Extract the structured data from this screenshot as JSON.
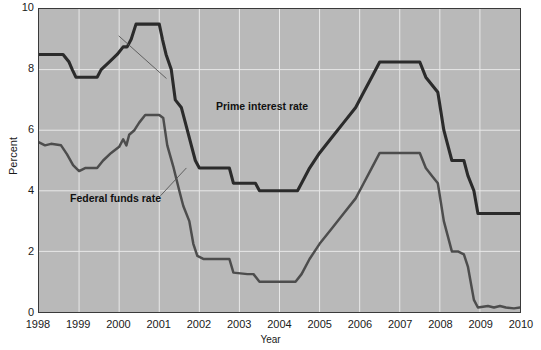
{
  "chart_data": {
    "type": "line",
    "title": "",
    "xlabel": "Year",
    "ylabel": "Percent",
    "xlim": [
      1998,
      2010
    ],
    "ylim": [
      0,
      10
    ],
    "grid": true,
    "legend_position": "inline-annotation",
    "x_tick_labels": [
      "1998",
      "1999",
      "2000",
      "2001",
      "2002",
      "2003",
      "2004",
      "2005",
      "2006",
      "2007",
      "2008",
      "2009",
      "2010"
    ],
    "y_tick_labels": [
      "0",
      "2",
      "4",
      "6",
      "8",
      "10"
    ],
    "y_ticks": [
      0,
      2,
      4,
      6,
      8,
      10
    ],
    "series": [
      {
        "name": "Prime interest rate",
        "color": "#2b2b2b",
        "annotation_label": "Prime interest rate",
        "points": [
          [
            1998.0,
            8.5
          ],
          [
            1998.6,
            8.5
          ],
          [
            1998.75,
            8.25
          ],
          [
            1998.83,
            8.0
          ],
          [
            1998.92,
            7.75
          ],
          [
            1999.45,
            7.75
          ],
          [
            1999.55,
            8.0
          ],
          [
            1999.75,
            8.25
          ],
          [
            1999.95,
            8.5
          ],
          [
            2000.1,
            8.75
          ],
          [
            2000.2,
            8.75
          ],
          [
            2000.3,
            9.0
          ],
          [
            2000.42,
            9.5
          ],
          [
            2000.95,
            9.5
          ],
          [
            2001.0,
            9.5
          ],
          [
            2001.08,
            9.0
          ],
          [
            2001.17,
            8.5
          ],
          [
            2001.3,
            8.0
          ],
          [
            2001.4,
            7.0
          ],
          [
            2001.55,
            6.75
          ],
          [
            2001.7,
            6.0
          ],
          [
            2001.8,
            5.5
          ],
          [
            2001.9,
            5.0
          ],
          [
            2002.0,
            4.75
          ],
          [
            2002.75,
            4.75
          ],
          [
            2002.85,
            4.25
          ],
          [
            2003.4,
            4.25
          ],
          [
            2003.5,
            4.0
          ],
          [
            2004.45,
            4.0
          ],
          [
            2004.55,
            4.25
          ],
          [
            2004.75,
            4.75
          ],
          [
            2005.0,
            5.25
          ],
          [
            2005.3,
            5.75
          ],
          [
            2005.6,
            6.25
          ],
          [
            2005.9,
            6.75
          ],
          [
            2006.1,
            7.25
          ],
          [
            2006.3,
            7.75
          ],
          [
            2006.5,
            8.25
          ],
          [
            2007.5,
            8.25
          ],
          [
            2007.65,
            7.75
          ],
          [
            2007.8,
            7.5
          ],
          [
            2007.95,
            7.25
          ],
          [
            2008.1,
            6.0
          ],
          [
            2008.3,
            5.0
          ],
          [
            2008.45,
            5.0
          ],
          [
            2008.6,
            5.0
          ],
          [
            2008.7,
            4.5
          ],
          [
            2008.85,
            4.0
          ],
          [
            2008.95,
            3.25
          ],
          [
            2010.0,
            3.25
          ]
        ]
      },
      {
        "name": "Federal funds rate",
        "color": "#4d4d4d",
        "annotation_label": "Federal funds rate",
        "points": [
          [
            1998.0,
            5.6
          ],
          [
            1998.15,
            5.5
          ],
          [
            1998.3,
            5.55
          ],
          [
            1998.55,
            5.5
          ],
          [
            1998.7,
            5.2
          ],
          [
            1998.85,
            4.85
          ],
          [
            1999.0,
            4.65
          ],
          [
            1999.15,
            4.75
          ],
          [
            1999.3,
            4.75
          ],
          [
            1999.45,
            4.75
          ],
          [
            1999.6,
            5.0
          ],
          [
            1999.8,
            5.25
          ],
          [
            2000.0,
            5.45
          ],
          [
            2000.1,
            5.7
          ],
          [
            2000.18,
            5.5
          ],
          [
            2000.25,
            5.85
          ],
          [
            2000.38,
            6.0
          ],
          [
            2000.5,
            6.25
          ],
          [
            2000.65,
            6.5
          ],
          [
            2000.8,
            6.5
          ],
          [
            2001.0,
            6.5
          ],
          [
            2001.1,
            6.4
          ],
          [
            2001.2,
            5.5
          ],
          [
            2001.35,
            4.8
          ],
          [
            2001.5,
            4.0
          ],
          [
            2001.6,
            3.5
          ],
          [
            2001.75,
            3.0
          ],
          [
            2001.85,
            2.25
          ],
          [
            2001.95,
            1.85
          ],
          [
            2002.1,
            1.75
          ],
          [
            2002.5,
            1.75
          ],
          [
            2002.75,
            1.75
          ],
          [
            2002.85,
            1.3
          ],
          [
            2003.2,
            1.25
          ],
          [
            2003.35,
            1.25
          ],
          [
            2003.5,
            1.0
          ],
          [
            2004.0,
            1.0
          ],
          [
            2004.4,
            1.0
          ],
          [
            2004.55,
            1.25
          ],
          [
            2004.75,
            1.75
          ],
          [
            2005.0,
            2.25
          ],
          [
            2005.3,
            2.75
          ],
          [
            2005.6,
            3.25
          ],
          [
            2005.9,
            3.75
          ],
          [
            2006.1,
            4.25
          ],
          [
            2006.3,
            4.75
          ],
          [
            2006.5,
            5.25
          ],
          [
            2007.5,
            5.25
          ],
          [
            2007.65,
            4.75
          ],
          [
            2007.8,
            4.5
          ],
          [
            2007.95,
            4.25
          ],
          [
            2008.1,
            3.0
          ],
          [
            2008.3,
            2.0
          ],
          [
            2008.45,
            2.0
          ],
          [
            2008.6,
            1.9
          ],
          [
            2008.7,
            1.5
          ],
          [
            2008.85,
            0.4
          ],
          [
            2008.95,
            0.15
          ],
          [
            2009.2,
            0.2
          ],
          [
            2009.35,
            0.15
          ],
          [
            2009.5,
            0.2
          ],
          [
            2009.65,
            0.15
          ],
          [
            2009.85,
            0.12
          ],
          [
            2010.0,
            0.15
          ]
        ]
      }
    ]
  },
  "axes": {
    "y_title": "Percent",
    "x_title": "Year"
  },
  "annotations": {
    "prime": "Prime interest rate",
    "fedfunds": "Federal funds rate"
  },
  "colors": {
    "plot_background": "#b9b9b9",
    "gridline": "#e8e8e8",
    "frame": "#3a3a3a",
    "prime_line": "#2b2b2b",
    "fedfunds_line": "#4d4d4d",
    "text": "#1a1a1a"
  }
}
